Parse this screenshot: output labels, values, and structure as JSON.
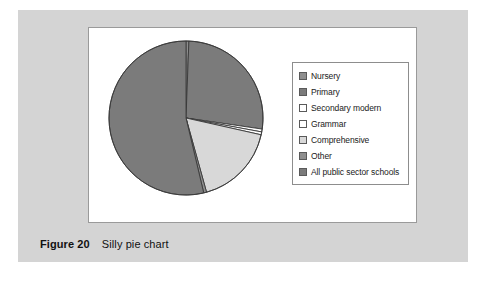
{
  "figure": {
    "caption_number": "Figure 20",
    "caption_text": "Silly pie chart",
    "panel_color": "#d4d4d4",
    "plot_background": "#ffffff",
    "plot_border_color": "#9a9a9a"
  },
  "legend": {
    "border_color": "#8d8d8d",
    "background": "#ffffff",
    "items": [
      {
        "label": "Nursery",
        "color": "#8e8e8e"
      },
      {
        "label": "Primary",
        "color": "#7b7b7b"
      },
      {
        "label": "Secondary modern",
        "color": "#ffffff"
      },
      {
        "label": "Grammar",
        "color": "#ffffff"
      },
      {
        "label": "Comprehensive",
        "color": "#d8d8d8"
      },
      {
        "label": "Other",
        "color": "#8e8e8e"
      },
      {
        "label": "All public sector schools",
        "color": "#7b7b7b"
      }
    ]
  },
  "chart_data": {
    "type": "pie",
    "title": "Silly pie chart",
    "xlabel": "",
    "ylabel": "",
    "legend_position": "right",
    "grid": false,
    "start_angle_deg": 0,
    "direction": "clockwise",
    "categories": [
      "Nursery",
      "Primary",
      "Secondary modern",
      "Grammar",
      "Comprehensive",
      "Other",
      "All public sector schools"
    ],
    "values": [
      0.6,
      26.7,
      0.6,
      0.6,
      17.2,
      0.6,
      53.7
    ],
    "slice_colors": [
      "#8e8e8e",
      "#7b7b7b",
      "#ffffff",
      "#ffffff",
      "#d8d8d8",
      "#8e8e8e",
      "#7b7b7b"
    ],
    "slice_angles_deg": [
      2,
      96,
      2,
      2,
      62,
      2,
      194
    ],
    "units": "percent",
    "stroke_color": "#3a3a3a"
  }
}
